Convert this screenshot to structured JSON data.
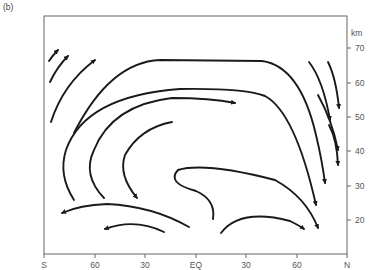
{
  "figure": {
    "panel_label": "(b)"
  },
  "axes": {
    "x": {
      "ticks": [
        {
          "label": "S",
          "pos": 44
        },
        {
          "label": "60",
          "pos": 95
        },
        {
          "label": "30",
          "pos": 145
        },
        {
          "label": "EQ",
          "pos": 196
        },
        {
          "label": "30",
          "pos": 246
        },
        {
          "label": "60",
          "pos": 297
        },
        {
          "label": "N",
          "pos": 347
        }
      ]
    },
    "y": {
      "unit_label": "km",
      "ticks": [
        {
          "label": "70",
          "pos": 48
        },
        {
          "label": "60",
          "pos": 83
        },
        {
          "label": "50",
          "pos": 117
        },
        {
          "label": "40",
          "pos": 151
        },
        {
          "label": "30",
          "pos": 186
        },
        {
          "label": "20",
          "pos": 220
        }
      ]
    }
  },
  "colors": {
    "stroke": "#1a1a1a",
    "frame": "#666666",
    "text": "#555555"
  },
  "streamlines": [
    {
      "name": "sh-upper-arrow-1",
      "d": "M49,61 Q53,55 58,50",
      "arrow": [
        58,
        50,
        1
      ]
    },
    {
      "name": "sh-upper-arrow-2",
      "d": "M50,82 Q57,67 68,56",
      "arrow": [
        68,
        56,
        1
      ]
    },
    {
      "name": "sh-upper-arrow-3",
      "d": "M51,122 Q63,84 95,60",
      "arrow": [
        95,
        60,
        1
      ]
    },
    {
      "name": "outer-cell",
      "d": "M74,133 Q110,62 160,60 L262,61 Q300,66 316,135 Q322,160 325,183",
      "arrow": [
        325,
        183,
        0
      ]
    },
    {
      "name": "mid-cell",
      "d": "M74,200 Q58,175 66,150 Q85,96 180,89 Q245,88 265,96 Q295,112 316,205",
      "arrow": [
        316,
        205,
        0
      ]
    },
    {
      "name": "inner-cell",
      "d": "M104,198 Q82,175 94,150 Q112,105 172,98 Q210,98 235,103",
      "arrow": [
        235,
        103,
        0
      ]
    },
    {
      "name": "innermost-return",
      "d": "M137,198 Q118,175 125,155 Q140,128 172,122",
      "arrow": [
        125,
        150,
        1
      ]
    },
    {
      "name": "lower-loop",
      "d": "M213,219 Q216,200 196,191 Q166,183 178,170 Q205,162 275,180 Q306,197 318,228",
      "arrow": [
        318,
        228,
        0
      ]
    },
    {
      "name": "lower-nh-arrow",
      "d": "M221,233 Q240,208 290,221 Q300,226 304,229",
      "arrow": [
        304,
        229,
        0
      ]
    },
    {
      "name": "lower-sh-return",
      "d": "M189,227 Q152,206 107,204 Q80,205 62,213",
      "arrow": [
        62,
        213,
        0
      ]
    },
    {
      "name": "lowest-sh-return",
      "d": "M164,232 Q135,218 105,229",
      "arrow": [
        105,
        229,
        0
      ]
    },
    {
      "name": "nh-polar-descent-1",
      "d": "M309,62 Q323,80 330,120",
      "arrow": [
        330,
        120,
        0
      ]
    },
    {
      "name": "nh-polar-descent-2",
      "d": "M328,62 Q336,78 339,108",
      "arrow": [
        339,
        108,
        0
      ]
    },
    {
      "name": "nh-polar-descent-3",
      "d": "M318,95 Q332,120 338,150",
      "arrow": [
        338,
        150,
        0
      ]
    },
    {
      "name": "nh-polar-descent-4",
      "d": "M329,125 Q337,140 338,165",
      "arrow": [
        338,
        165,
        0
      ]
    }
  ]
}
